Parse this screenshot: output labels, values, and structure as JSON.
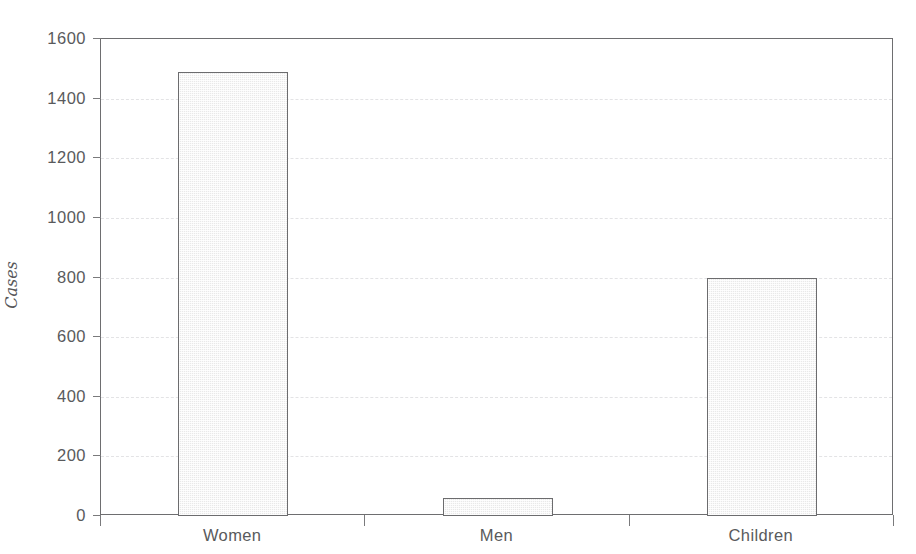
{
  "chart_data": {
    "type": "bar",
    "title": "",
    "subtitle": "",
    "xlabel": "",
    "ylabel": "Cases",
    "categories": [
      "Women",
      "Men",
      "Children"
    ],
    "values": [
      1490,
      60,
      800
    ],
    "series": [
      {
        "name": "Cases",
        "values": [
          1490,
          60,
          800
        ]
      }
    ],
    "ylim": [
      0,
      1600
    ],
    "ytick_labels": [
      "0",
      "200",
      "400",
      "600",
      "800",
      "1000",
      "1200",
      "1400",
      "1600"
    ],
    "ytick_values": [
      0,
      200,
      400,
      600,
      800,
      1000,
      1200,
      1400,
      1600
    ],
    "grid": "horizontal-dashed",
    "legend": "none",
    "annotations": [],
    "colors": {
      "bar_fill": "#e9e9e9",
      "bar_border": "#6c6c6e",
      "axis": "#6e6e70",
      "gridline": "#e3e3e5",
      "text": "#58585a",
      "background": "#ffffff"
    }
  }
}
